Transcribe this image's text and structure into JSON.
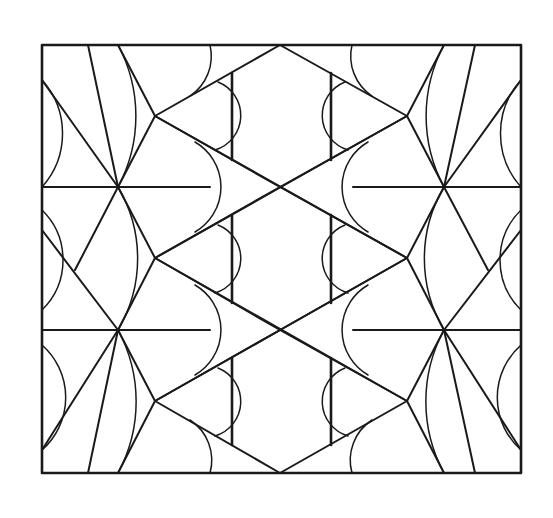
{
  "figure": {
    "kind": "geometric-pattern-line-drawing",
    "stroke_color": "#1a1a1a",
    "background_color": "#ffffff",
    "frame": {
      "x1": 42,
      "y1": 45,
      "x2": 521,
      "y2": 473
    },
    "row_lines_y": [
      187,
      330
    ],
    "center_crossings": [
      [
        280,
        187
      ],
      [
        280,
        330
      ]
    ],
    "side_nodes": [
      [
        118,
        187
      ],
      [
        118,
        330
      ],
      [
        444,
        187
      ],
      [
        444,
        330
      ]
    ],
    "kite_tips": [
      [
        155,
        116
      ],
      [
        155,
        258
      ],
      [
        155,
        401
      ],
      [
        407,
        116
      ],
      [
        407,
        258
      ],
      [
        407,
        401
      ]
    ],
    "vertical_bars_x": [
      232,
      331
    ]
  }
}
